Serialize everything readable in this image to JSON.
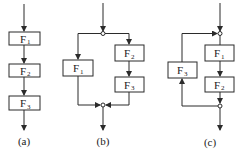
{
  "diagrams": [
    {
      "caption": "(a)",
      "type": "series",
      "blocks": [
        {
          "name": "F",
          "sub": "1"
        },
        {
          "name": "F",
          "sub": "2"
        },
        {
          "name": "F",
          "sub": "3"
        }
      ]
    },
    {
      "caption": "(b)",
      "type": "parallel",
      "blocks": [
        {
          "name": "F",
          "sub": "1"
        },
        {
          "name": "F",
          "sub": "2"
        },
        {
          "name": "F",
          "sub": "3"
        }
      ]
    },
    {
      "caption": "(c)",
      "type": "feedback",
      "blocks": [
        {
          "name": "F",
          "sub": "1"
        },
        {
          "name": "F",
          "sub": "2"
        },
        {
          "name": "F",
          "sub": "3"
        }
      ]
    }
  ]
}
